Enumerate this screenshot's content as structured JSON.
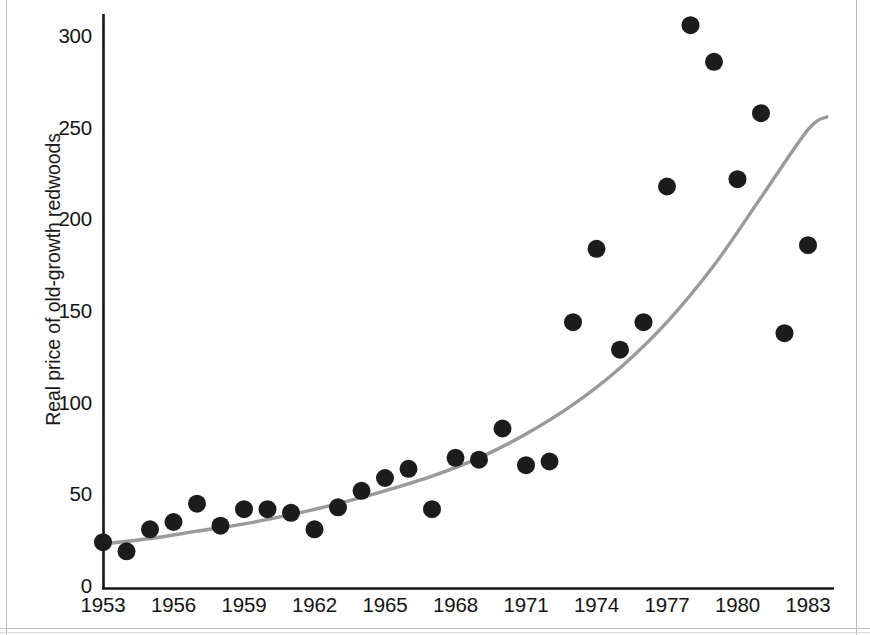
{
  "chart_data": {
    "type": "scatter",
    "title": "",
    "subtitle": "",
    "xlabel": "",
    "ylabel": "Real price of old-growth redwoods",
    "xlim": [
      1952.3,
      1984.0
    ],
    "ylim": [
      0,
      320
    ],
    "grid": false,
    "legend": null,
    "x_tick_labels": [
      "1953",
      "1956",
      "1959",
      "1962",
      "1965",
      "1968",
      "1971",
      "1974",
      "1977",
      "1980",
      "1983"
    ],
    "x_ticks": [
      1953,
      1956,
      1959,
      1962,
      1965,
      1968,
      1971,
      1974,
      1977,
      1980,
      1983
    ],
    "y_tick_labels": [
      "0",
      "50",
      "100",
      "150",
      "200",
      "250",
      "300"
    ],
    "y_ticks": [
      0,
      50,
      100,
      150,
      200,
      250,
      300
    ],
    "marker": {
      "shape": "circle",
      "color": "#1c1c1c",
      "radius_px": 9
    },
    "series": [
      {
        "name": "Real price of old-growth redwoods",
        "kind": "scatter",
        "x": [
          1953,
          1954,
          1955,
          1956,
          1957,
          1958,
          1959,
          1960,
          1961,
          1962,
          1963,
          1964,
          1965,
          1966,
          1967,
          1968,
          1969,
          1970,
          1971,
          1972,
          1973,
          1974,
          1975,
          1976,
          1977,
          1978,
          1979,
          1980,
          1981,
          1982,
          1983
        ],
        "values": [
          25,
          20,
          32,
          36,
          46,
          34,
          43,
          43,
          41,
          32,
          44,
          53,
          60,
          65,
          43,
          71,
          70,
          87,
          67,
          69,
          145,
          185,
          130,
          145,
          219,
          307,
          287,
          223,
          259,
          139,
          187
        ]
      },
      {
        "name": "fitted exponential trend",
        "kind": "line",
        "color": "#9a9a9a",
        "x": [
          1953,
          1955,
          1957,
          1959,
          1961,
          1963,
          1965,
          1967,
          1969,
          1971,
          1973,
          1975,
          1977,
          1979,
          1981,
          1983,
          1983.8
        ],
        "values": [
          24,
          27,
          31,
          35,
          40,
          46,
          53,
          61,
          71,
          84,
          100,
          120,
          145,
          176,
          213,
          250,
          257
        ]
      }
    ]
  },
  "axis": {
    "y_title": "Real price of old-growth redwoods"
  }
}
